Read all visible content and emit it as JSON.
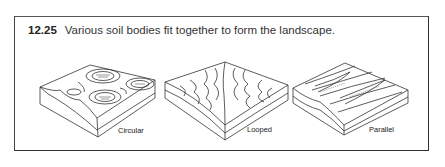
{
  "figure": {
    "number": "12.25",
    "caption": "Various soil bodies fit together to form the landscape.",
    "panels": [
      {
        "label": "Circular",
        "pattern": "circular"
      },
      {
        "label": "Looped",
        "pattern": "looped"
      },
      {
        "label": "Parallel",
        "pattern": "parallel"
      }
    ]
  }
}
